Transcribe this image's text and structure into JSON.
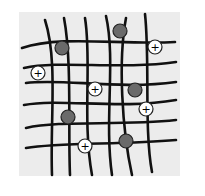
{
  "diagram": {
    "type": "polymer network with fixed and mobile charges",
    "background_color": "#ececec",
    "line_color": "#111111",
    "fixed_site_color": "#6a6a6a",
    "counter_ion_fill": "#ffffff",
    "counter_ion_symbol": "+",
    "fixed_sites": [
      {
        "x": 120,
        "y": 31
      },
      {
        "x": 62,
        "y": 48
      },
      {
        "x": 135,
        "y": 90
      },
      {
        "x": 68,
        "y": 117
      },
      {
        "x": 126,
        "y": 141
      }
    ],
    "counter_ions": [
      {
        "x": 155,
        "y": 47,
        "label": "+"
      },
      {
        "x": 38,
        "y": 73,
        "label": "+"
      },
      {
        "x": 95,
        "y": 89,
        "label": "+"
      },
      {
        "x": 146,
        "y": 109,
        "label": "+"
      },
      {
        "x": 85,
        "y": 146,
        "label": "+"
      }
    ]
  }
}
